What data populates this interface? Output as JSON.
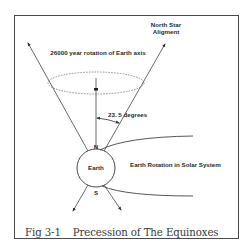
{
  "figure": {
    "caption_number": "Fig 3-1",
    "caption_title": "Precession of The Equinoxes",
    "colors": {
      "line": "#3a3a3a",
      "frame": "#4a4a4a",
      "dashed": "#777777",
      "background": "#ffffff"
    }
  },
  "labels": {
    "north_star_line1": "North Star",
    "north_star_line2": "Aligment",
    "rotation_axis": "26000 year rotation of Earth axis",
    "tilt_angle": "23. 5 degrees",
    "earth": "Earth",
    "north_pole": "N",
    "south_pole": "S",
    "solar_rotation": "Earth Rotation in Solar System"
  }
}
